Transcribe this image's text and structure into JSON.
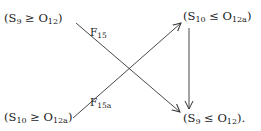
{
  "diagram": {
    "type": "commutative-diagram",
    "nodes": {
      "top_left": {
        "open": "(S",
        "s_sub": "9",
        "rel": " ≥ O",
        "o_sub": "12",
        "close": ")"
      },
      "top_right": {
        "open": "(S",
        "s_sub": "10",
        "rel": " ≤ O",
        "o_sub": "12a",
        "close": ")"
      },
      "bottom_left": {
        "open": "(S",
        "s_sub": "10",
        "rel": " ≥ O",
        "o_sub": "12a",
        "close": ")"
      },
      "bottom_right": {
        "open": "(S",
        "s_sub": "9",
        "rel": " ≤ O",
        "o_sub": "12",
        "close": ")."
      }
    },
    "edges": [
      {
        "from": "top_left",
        "to": "bottom_right",
        "label": {
          "base": "F",
          "sub": "15"
        }
      },
      {
        "from": "bottom_left",
        "to": "top_right",
        "label": {
          "base": "F",
          "sub": "15a"
        }
      },
      {
        "from": "top_right",
        "to": "bottom_right",
        "label": null
      }
    ],
    "colors": {
      "stroke": "#333333",
      "text": "#1a1a1a"
    }
  }
}
